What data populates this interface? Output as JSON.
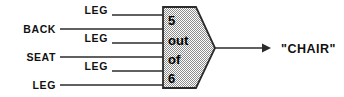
{
  "diagram": {
    "type": "threshold-logic-unit",
    "colors": {
      "stroke": "#2b2b2b",
      "text": "#111111",
      "gate_fill_light": "#ffffff",
      "gate_fill_dark": "#8d8d8d",
      "background": "#ffffff"
    },
    "gate": {
      "name": "threshold-gate",
      "lines": [
        {
          "text": "5"
        },
        {
          "text": "out"
        },
        {
          "text": "of"
        },
        {
          "text": "6"
        }
      ],
      "threshold": 5,
      "total_inputs": 6
    },
    "inputs": [
      {
        "index": 0,
        "label": "LEG",
        "position": "upper",
        "y": 15
      },
      {
        "index": 1,
        "label": "BACK",
        "position": "outer",
        "y": 29
      },
      {
        "index": 2,
        "label": "LEG",
        "position": "upper",
        "y": 43
      },
      {
        "index": 3,
        "label": "SEAT",
        "position": "outer",
        "y": 57
      },
      {
        "index": 4,
        "label": "LEG",
        "position": "upper",
        "y": 71
      },
      {
        "index": 5,
        "label": "LEG",
        "position": "outer",
        "y": 85
      }
    ],
    "output": {
      "label": "\"CHAIR\"",
      "name": "output-chair"
    }
  }
}
